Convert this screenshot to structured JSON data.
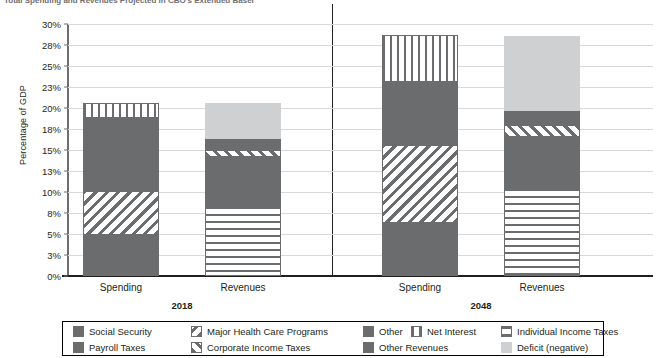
{
  "title": {
    "text": "Total Spending and Revenues Projected in CBO's Extended Baseline"
  },
  "chart_data": {
    "type": "bar",
    "subtype": "stacked",
    "title": "Total Spending and Revenues Projected in CBO's Extended Baseline",
    "xlabel": "",
    "ylabel": "Percentage of GDP",
    "ylim": [
      0,
      30
    ],
    "grid": true,
    "legend_position": "bottom",
    "ytick_labels": [
      "0%",
      "3%",
      "5%",
      "8%",
      "10%",
      "13%",
      "15%",
      "18%",
      "20%",
      "23%",
      "25%",
      "28%",
      "30%"
    ],
    "ytick_values": [
      0,
      2.5,
      5,
      7.5,
      10,
      12.5,
      15,
      17.5,
      20,
      22.5,
      25,
      27.5,
      30
    ],
    "groups": [
      "2018",
      "2048"
    ],
    "categories": [
      "Spending",
      "Revenues",
      "Spending",
      "Revenues"
    ],
    "bars": [
      {
        "group": "2018",
        "category": "Spending",
        "total": 20.6,
        "segments": [
          {
            "name": "Social Security",
            "value": 4.9,
            "fill": "solid-dark"
          },
          {
            "name": "Major Health Care Programs",
            "value": 5.2,
            "fill": "diag"
          },
          {
            "name": "Other",
            "value": 8.7,
            "fill": "solid-dark"
          },
          {
            "name": "Net Interest",
            "value": 1.8,
            "fill": "vert"
          }
        ]
      },
      {
        "group": "2018",
        "category": "Revenues",
        "total": 20.6,
        "segments": [
          {
            "name": "Individual Income Taxes",
            "value": 8.3,
            "fill": "horz"
          },
          {
            "name": "Payroll Taxes",
            "value": 5.9,
            "fill": "solid-dark"
          },
          {
            "name": "Corporate Income Taxes",
            "value": 0.8,
            "fill": "diag2"
          },
          {
            "name": "Other Revenues",
            "value": 1.3,
            "fill": "solid-mid"
          },
          {
            "name": "Deficit (negative)",
            "value": 4.3,
            "fill": "light"
          }
        ]
      },
      {
        "group": "2048",
        "category": "Spending",
        "total": 28.7,
        "segments": [
          {
            "name": "Social Security",
            "value": 6.3,
            "fill": "solid-dark"
          },
          {
            "name": "Major Health Care Programs",
            "value": 9.3,
            "fill": "diag"
          },
          {
            "name": "Other",
            "value": 7.5,
            "fill": "solid-dark"
          },
          {
            "name": "Net Interest",
            "value": 5.6,
            "fill": "vert"
          }
        ]
      },
      {
        "group": "2048",
        "category": "Revenues",
        "total": 28.6,
        "segments": [
          {
            "name": "Individual Income Taxes",
            "value": 10.5,
            "fill": "horz"
          },
          {
            "name": "Payroll Taxes",
            "value": 6.1,
            "fill": "solid-dark"
          },
          {
            "name": "Corporate Income Taxes",
            "value": 1.4,
            "fill": "diag2"
          },
          {
            "name": "Other Revenues",
            "value": 1.6,
            "fill": "solid-mid"
          },
          {
            "name": "Deficit (negative)",
            "value": 9.0,
            "fill": "light"
          }
        ]
      }
    ],
    "legend": [
      {
        "label": "Social Security",
        "fill": "solid-dark"
      },
      {
        "label": "Major Health Care Programs",
        "fill": "diag"
      },
      {
        "label": "Other",
        "fill": "solid-dark"
      },
      {
        "label": "Net Interest",
        "fill": "vert"
      },
      {
        "label": "Individual Income Taxes",
        "fill": "horz"
      },
      {
        "label": "Payroll Taxes",
        "fill": "solid-dark"
      },
      {
        "label": "Corporate Income Taxes",
        "fill": "diag2"
      },
      {
        "label": "Other Revenues",
        "fill": "solid-mid"
      },
      {
        "label": "Deficit (negative)",
        "fill": "light"
      }
    ],
    "colors": {
      "dark_gray": "#6a6c6e",
      "light_gray": "#cfd0d2",
      "grid": "#d9d9d9",
      "axis": "#231f20",
      "background": "#ffffff"
    }
  },
  "axis": {
    "ylabel": "Percentage of GDP",
    "ticks": [
      "30%",
      "28%",
      "25%",
      "23%",
      "20%",
      "18%",
      "15%",
      "13%",
      "10%",
      "8%",
      "5%",
      "3%",
      "0%"
    ]
  },
  "group_labels": [
    "2018",
    "2048"
  ],
  "category_labels": [
    "Spending",
    "Revenues",
    "Spending",
    "Revenues"
  ]
}
